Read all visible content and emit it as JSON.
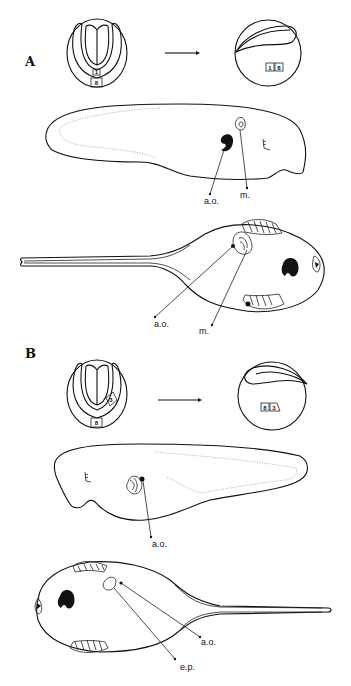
{
  "figure": {
    "panels": [
      {
        "id": "A",
        "label": "A",
        "early_embryo_box_top": "1",
        "early_embryo_box_bottom": "8",
        "late_embryo_box_left": "1",
        "late_embryo_box_right": "8",
        "lateral_view_labels": [
          "a.o.",
          "m."
        ],
        "ventral_view_labels": [
          "a.o.",
          "m."
        ]
      },
      {
        "id": "B",
        "label": "B",
        "early_embryo_box_side": "3",
        "early_embryo_box_bottom": "8",
        "late_embryo_box_left": "8",
        "late_embryo_box_right": "3",
        "lateral_view_labels": [
          "a.o."
        ],
        "ventral_view_labels": [
          "a.o.",
          "e.p."
        ]
      }
    ]
  }
}
